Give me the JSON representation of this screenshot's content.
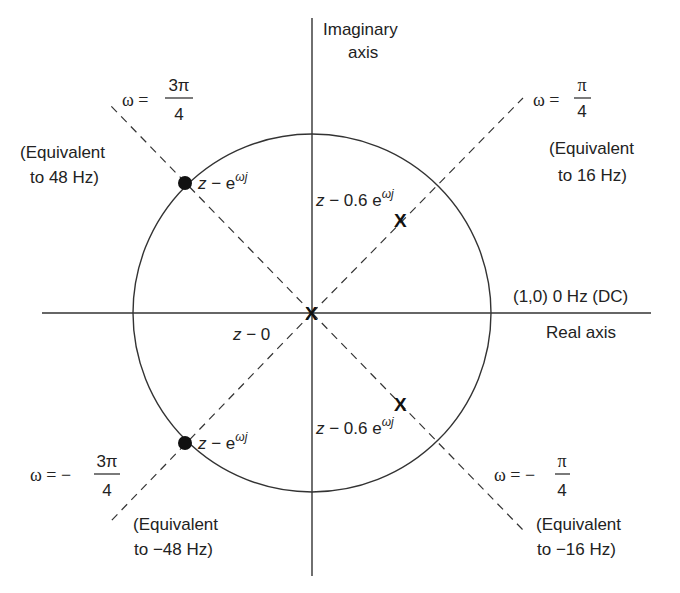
{
  "axes": {
    "imaginary_label_line1": "Imaginary",
    "imaginary_label_line2": "axis",
    "real_label": "Real axis",
    "dc_label": "(1,0) 0 Hz (DC)"
  },
  "lines": {
    "q1": {
      "omega_prefix": "ω =",
      "numerator": "π",
      "denominator": "4",
      "equiv_line1": "(Equivalent",
      "equiv_line2": "to 16 Hz)"
    },
    "q2": {
      "omega_prefix": "ω =",
      "numerator": "3π",
      "denominator": "4",
      "equiv_line1": "(Equivalent",
      "equiv_line2": "to 48 Hz)"
    },
    "q3": {
      "omega_prefix": "ω = −",
      "numerator": "3π",
      "denominator": "4",
      "equiv_line1": "(Equivalent",
      "equiv_line2": "to −48 Hz)"
    },
    "q4": {
      "omega_prefix": "ω = −",
      "numerator": "π",
      "denominator": "4",
      "equiv_line1": "(Equivalent",
      "equiv_line2": "to −16 Hz)"
    }
  },
  "zeros": [
    {
      "label_z": "z",
      "label_rest": " − e",
      "sup": "ωj",
      "angle": "3π/4"
    },
    {
      "label_z": "z",
      "label_rest": " − e",
      "sup": "ωj",
      "angle": "-3π/4"
    }
  ],
  "poles": [
    {
      "marker": "X",
      "label_z": "z",
      "label_rest": " − 0.6 e",
      "sup": "ωj",
      "angle": "π/4"
    },
    {
      "marker": "X",
      "label_z": "z",
      "label_rest": " − 0",
      "sup": "",
      "angle": "0"
    },
    {
      "marker": "X",
      "label_z": "z",
      "label_rest": " − 0.6 e",
      "sup": "ωj",
      "angle": "-π/4"
    }
  ],
  "colors": {
    "ink": "#222222",
    "background": "#ffffff"
  }
}
